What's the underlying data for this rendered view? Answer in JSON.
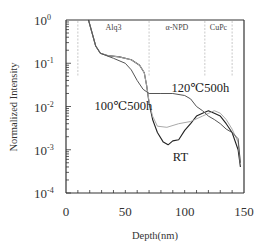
{
  "chart_data": {
    "type": "line",
    "title": "",
    "xlabel": "Depth(nm)",
    "ylabel": "Normalized Intensity",
    "xlim": [
      0,
      150
    ],
    "ylim": [
      0.0001,
      1
    ],
    "yscale": "log",
    "grid": false,
    "legend": null,
    "x_ticks": [
      0,
      50,
      100,
      150
    ],
    "x_tick_labels": [
      "0",
      "50",
      "100",
      "150"
    ],
    "y_ticks": [
      1,
      0.1,
      0.01,
      0.001,
      0.0001
    ],
    "y_tick_labels": [
      {
        "base": "10",
        "exp": "0"
      },
      {
        "base": "10",
        "exp": "-1"
      },
      {
        "base": "10",
        "exp": "-2"
      },
      {
        "base": "10",
        "exp": "-3"
      },
      {
        "base": "10",
        "exp": "-4"
      }
    ],
    "layer_regions": [
      {
        "label": "Alq3",
        "x_start": 10,
        "x_end": 70
      },
      {
        "label": "α-NPD",
        "x_start": 70,
        "x_end": 117
      },
      {
        "label": "CuPc",
        "x_start": 117,
        "x_end": 140
      }
    ],
    "series": [
      {
        "name": "RT",
        "color": "#222222",
        "x": [
          19,
          22,
          25,
          29,
          35,
          45,
          55,
          62,
          66,
          68,
          70,
          73,
          77,
          82,
          86,
          90,
          95,
          100,
          105,
          110,
          115,
          120,
          125,
          130,
          135,
          140,
          145,
          147
        ],
        "y": [
          1.0,
          0.5,
          0.25,
          0.17,
          0.15,
          0.14,
          0.12,
          0.09,
          0.06,
          0.03,
          0.012,
          0.005,
          0.0025,
          0.0015,
          0.0013,
          0.0016,
          0.0017,
          0.0028,
          0.004,
          0.006,
          0.007,
          0.008,
          0.007,
          0.006,
          0.004,
          0.0025,
          0.001,
          0.0004
        ]
      },
      {
        "name": "100℃500h",
        "color": "#aaaaaa",
        "x": [
          19,
          22,
          25,
          29,
          35,
          45,
          55,
          62,
          66,
          68,
          70,
          73,
          77,
          85,
          95,
          105,
          115,
          125,
          130,
          135,
          140,
          145,
          147
        ],
        "y": [
          1.0,
          0.5,
          0.25,
          0.17,
          0.15,
          0.14,
          0.12,
          0.09,
          0.06,
          0.03,
          0.013,
          0.006,
          0.0035,
          0.0033,
          0.004,
          0.0045,
          0.006,
          0.008,
          0.007,
          0.005,
          0.003,
          0.0015,
          0.0005
        ]
      },
      {
        "name": "120℃500h",
        "color": "#555555",
        "x": [
          19,
          22,
          25,
          29,
          40,
          50,
          55,
          60,
          65,
          70,
          80,
          90,
          100,
          105,
          110,
          115,
          120,
          125,
          130,
          135,
          140,
          145,
          147
        ],
        "y": [
          1.0,
          0.5,
          0.25,
          0.17,
          0.13,
          0.1,
          0.07,
          0.04,
          0.025,
          0.02,
          0.02,
          0.02,
          0.018,
          0.015,
          0.01,
          0.008,
          0.006,
          0.005,
          0.004,
          0.003,
          0.0025,
          0.0018,
          0.0005
        ]
      }
    ],
    "annotations": [
      {
        "text": "120℃500h",
        "x": 89,
        "y": 0.022
      },
      {
        "text": "100℃500h",
        "x": 24,
        "y": 0.0085
      },
      {
        "text": "RT",
        "x": 90,
        "y": 0.00055
      }
    ]
  }
}
